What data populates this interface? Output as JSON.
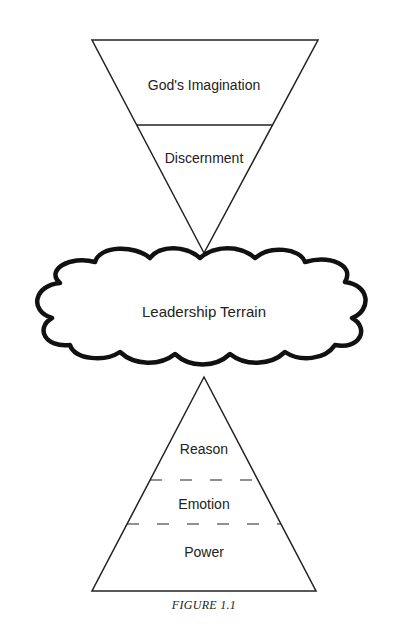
{
  "figure": {
    "caption": "FIGURE 1.1",
    "top_triangle": {
      "orientation": "inverted",
      "sections": [
        {
          "label": "God's Imagination"
        },
        {
          "label": "Discernment"
        }
      ],
      "divider": "solid"
    },
    "cloud": {
      "label": "Leadership Terrain"
    },
    "bottom_triangle": {
      "orientation": "upright",
      "sections": [
        {
          "label": "Reason"
        },
        {
          "label": "Emotion"
        },
        {
          "label": "Power"
        }
      ],
      "divider": "dashed"
    }
  }
}
